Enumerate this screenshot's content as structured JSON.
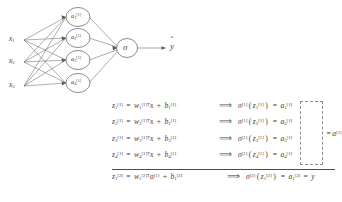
{
  "diagram": {
    "inputs": [
      {
        "name": "input-x1",
        "base": "x",
        "sub": "1"
      },
      {
        "name": "input-x2",
        "base": "x",
        "sub": "2"
      },
      {
        "name": "input-x3",
        "base": "x",
        "sub": "3"
      }
    ],
    "hidden_nodes": [
      {
        "name": "hidden-node-1",
        "base": "a",
        "sub": "1",
        "sup": "[1]"
      },
      {
        "name": "hidden-node-2",
        "base": "a",
        "sub": "2",
        "sup": "[1]"
      },
      {
        "name": "hidden-node-3",
        "base": "a",
        "sub": "3",
        "sup": "[1]"
      },
      {
        "name": "hidden-node-4",
        "base": "a",
        "sub": "4",
        "sup": "[1]"
      }
    ],
    "output_node": {
      "name": "output-node-sigma",
      "label": "σ"
    },
    "prediction": {
      "name": "prediction-yhat",
      "base": "y",
      "hat": "ˆ"
    },
    "stroke_color": "#5a5a5a",
    "node_fill": "#ffffff"
  },
  "equations": {
    "arrow": "⟹",
    "rows": [
      {
        "z": {
          "base": "z",
          "sub": "1",
          "sup": "[1]"
        },
        "w": {
          "base": "w",
          "sub": "1",
          "sup": "[1]T"
        },
        "x": "x",
        "b": {
          "base": "b",
          "sub": "1",
          "sup": "[1]"
        },
        "sigma": {
          "base": "σ",
          "sup": "[1]"
        },
        "arg": {
          "base": "z",
          "sub": "1",
          "sup": "[1]"
        },
        "a": {
          "base": "a",
          "sub": "1",
          "sup": "[1]"
        }
      },
      {
        "z": {
          "base": "z",
          "sub": "2",
          "sup": "[1]"
        },
        "w": {
          "base": "w",
          "sub": "2",
          "sup": "[1]T"
        },
        "x": "x",
        "b": {
          "base": "b",
          "sub": "2",
          "sup": "[1]"
        },
        "sigma": {
          "base": "σ",
          "sup": "[1]"
        },
        "arg": {
          "base": "z",
          "sub": "2",
          "sup": "[1]"
        },
        "a": {
          "base": "a",
          "sub": "2",
          "sup": "[1]"
        }
      },
      {
        "z": {
          "base": "z",
          "sub": "3",
          "sup": "[1]"
        },
        "w": {
          "base": "w",
          "sub": "3",
          "sup": "[1]T"
        },
        "x": "x",
        "b": {
          "base": "b",
          "sub": "3",
          "sup": "[1]"
        },
        "sigma": {
          "base": "σ",
          "sup": "[1]"
        },
        "arg": {
          "base": "z",
          "sub": "3",
          "sup": "[1]"
        },
        "a": {
          "base": "a",
          "sub": "3",
          "sup": "[1]"
        }
      },
      {
        "z": {
          "base": "z",
          "sub": "4",
          "sup": "[1]"
        },
        "w": {
          "base": "w",
          "sub": "4",
          "sup": "[1]T"
        },
        "x": "x",
        "b": {
          "base": "b",
          "sub": "4",
          "sup": "[1]"
        },
        "sigma": {
          "base": "σ",
          "sup": "[1]"
        },
        "arg": {
          "base": "z",
          "sub": "4",
          "sup": "[1]"
        },
        "a": {
          "base": "a",
          "sub": "4",
          "sup": "[1]"
        }
      }
    ],
    "vector_annotation": {
      "equals": "=",
      "base": "a",
      "sup": "[1]"
    },
    "final_row": {
      "z": {
        "base": "z",
        "sub": "1",
        "sup": "[2]"
      },
      "w": {
        "base": "w",
        "sub": "1",
        "sup": "[2]T"
      },
      "a_in": {
        "base": "a",
        "sup": "[1]"
      },
      "b": {
        "base": "b",
        "sub": "1",
        "sup": "[2]"
      },
      "sigma": {
        "base": "σ",
        "sup": "[2]"
      },
      "arg": {
        "base": "z",
        "sub": "1",
        "sup": "[2]"
      },
      "a_out": {
        "base": "a",
        "sub": "1",
        "sup": "[2]"
      },
      "yhat": {
        "base": "y",
        "hat": "ˆ"
      }
    },
    "operators": {
      "equals": "=",
      "plus": "+",
      "times": ""
    }
  }
}
